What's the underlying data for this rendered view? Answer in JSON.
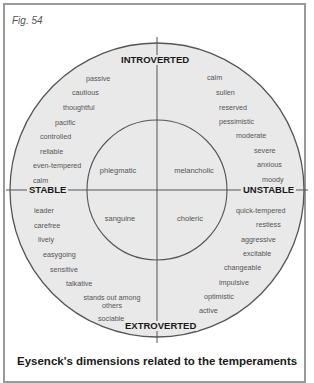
{
  "figure": {
    "label": "Fig. 54",
    "caption": "Eysenck's dimensions related to the temperaments",
    "colors": {
      "circle_fill": "#e9e9e9",
      "stroke": "#555555",
      "frame": "#9a9a9a",
      "text": "#555555",
      "bold_text": "#1a1a1a"
    }
  },
  "axes": {
    "top": "INTROVERTED",
    "bottom": "EXTROVERTED",
    "left": "STABLE",
    "right": "UNSTABLE"
  },
  "temperaments": {
    "top_left": "phlegmatic",
    "top_right": "melancholic",
    "bottom_left": "sanguine",
    "bottom_right": "choleric"
  },
  "traits": {
    "introverted_stable": [
      "passive",
      "cautious",
      "thoughtful",
      "pacific",
      "controlled",
      "reliable",
      "even-tempered",
      "calm"
    ],
    "introverted_unstable": [
      "calm",
      "sullen",
      "reserved",
      "pessimistic",
      "moderate",
      "severe",
      "anxious",
      "moody"
    ],
    "extroverted_stable": [
      "leader",
      "carefree",
      "lively",
      "easygoing",
      "sensitive",
      "talkative",
      "stands out among others",
      "sociable"
    ],
    "extroverted_unstable": [
      "quick-tempered",
      "restless",
      "aggressive",
      "excitable",
      "changeable",
      "impulsive",
      "optimistic",
      "active"
    ]
  }
}
